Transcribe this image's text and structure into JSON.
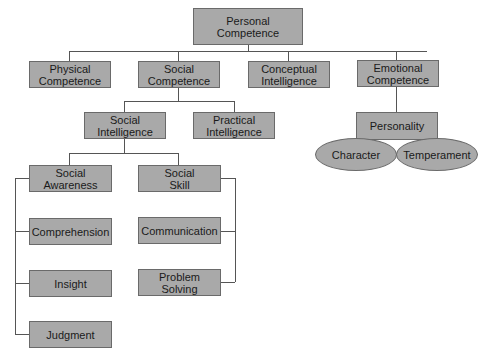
{
  "diagram": {
    "type": "hierarchy",
    "colors": {
      "box_fill": "#a9a9a9",
      "box_border": "#6a6a6a",
      "line": "#555555"
    },
    "nodes": {
      "personal_competence": "Personal\nCompetence",
      "physical_competence": "Physical\nCompetence",
      "social_competence": "Social\nCompetence",
      "conceptual_intelligence": "Conceptual\nIntelligence",
      "emotional_competence": "Emotional\nCompetence",
      "social_intelligence": "Social\nIntelligence",
      "practical_intelligence": "Practical\nIntelligence",
      "personality": "Personality",
      "character": "Character",
      "temperament": "Temperament",
      "social_awareness": "Social\nAwareness",
      "social_skill": "Social\nSkill",
      "comprehension": "Comprehension",
      "insight": "Insight",
      "judgment": "Judgment",
      "communication": "Communication",
      "problem_solving": "Problem\nSolving"
    },
    "edges": [
      [
        "Personal Competence",
        "Physical Competence"
      ],
      [
        "Personal Competence",
        "Social Competence"
      ],
      [
        "Personal Competence",
        "Conceptual Intelligence"
      ],
      [
        "Personal Competence",
        "Emotional Competence"
      ],
      [
        "Social Competence",
        "Social Intelligence"
      ],
      [
        "Social Competence",
        "Practical Intelligence"
      ],
      [
        "Emotional Competence",
        "Personality"
      ],
      [
        "Personality",
        "Character"
      ],
      [
        "Personality",
        "Temperament"
      ],
      [
        "Social Intelligence",
        "Social Awareness"
      ],
      [
        "Social Intelligence",
        "Social Skill"
      ],
      [
        "Social Awareness",
        "Comprehension"
      ],
      [
        "Social Awareness",
        "Insight"
      ],
      [
        "Social Awareness",
        "Judgment"
      ],
      [
        "Social Skill",
        "Communication"
      ],
      [
        "Social Skill",
        "Problem Solving"
      ]
    ]
  }
}
